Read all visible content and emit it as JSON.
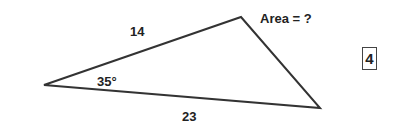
{
  "figure": {
    "type": "triangle",
    "vertices": {
      "left": [
        44,
        85
      ],
      "top": [
        241,
        17
      ],
      "bottom_right": [
        320,
        108
      ]
    },
    "labels": {
      "side_top": "14",
      "side_bottom": "23",
      "angle": "35°",
      "question": "Area = ?",
      "problem_number": "4"
    },
    "stroke_color": "#333333"
  }
}
